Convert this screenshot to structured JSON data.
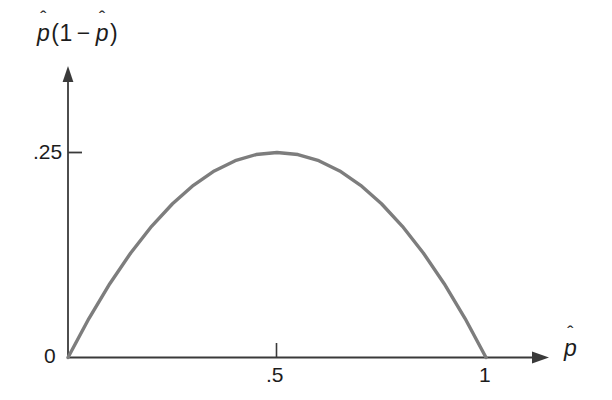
{
  "chart_data": {
    "type": "line",
    "title": "",
    "subtitle": "",
    "xlabel": "p̂",
    "ylabel": "p̂(1 − p̂)",
    "xlim": [
      0,
      1.19
    ],
    "ylim": [
      0,
      0.327
    ],
    "grid": false,
    "legend": null,
    "annotations": [],
    "x_ticks": [
      {
        "value": 0.5,
        "label": ".5"
      },
      {
        "value": 1.0,
        "label": "1"
      }
    ],
    "y_ticks": [
      {
        "value": 0,
        "label": "0"
      },
      {
        "value": 0.25,
        "label": ".25"
      }
    ],
    "series": [
      {
        "name": "p̂(1 − p̂)",
        "color": "#7d7d7d",
        "linewidth": 3.4,
        "formula": "y = x * (1 - x)",
        "x": [
          0,
          0.05,
          0.1,
          0.15,
          0.2,
          0.25,
          0.3,
          0.35,
          0.4,
          0.45,
          0.5,
          0.55,
          0.6,
          0.65,
          0.7,
          0.75,
          0.8,
          0.85,
          0.9,
          0.95,
          1
        ],
        "values": [
          0,
          0.0475,
          0.09,
          0.1275,
          0.16,
          0.1875,
          0.21,
          0.2275,
          0.24,
          0.2475,
          0.25,
          0.2475,
          0.24,
          0.2275,
          0.21,
          0.1875,
          0.16,
          0.1275,
          0.09,
          0.0475,
          0
        ]
      }
    ]
  },
  "axes": {
    "y_caption": {
      "var_symbol": "p",
      "hat": "ˆ",
      "open_paren": "(",
      "one": "1",
      "minus": "−",
      "close_paren": ")"
    },
    "x_caption": {
      "var_symbol": "p",
      "hat": "ˆ"
    },
    "origin_label": "0",
    "y_tick_label": ".25",
    "x_tick_labels": [
      ".5",
      "1"
    ]
  },
  "colors": {
    "background": "#ffffff",
    "axis": "#3a3a3a",
    "curve": "#7d7d7d",
    "text": "#1c1c1c"
  }
}
